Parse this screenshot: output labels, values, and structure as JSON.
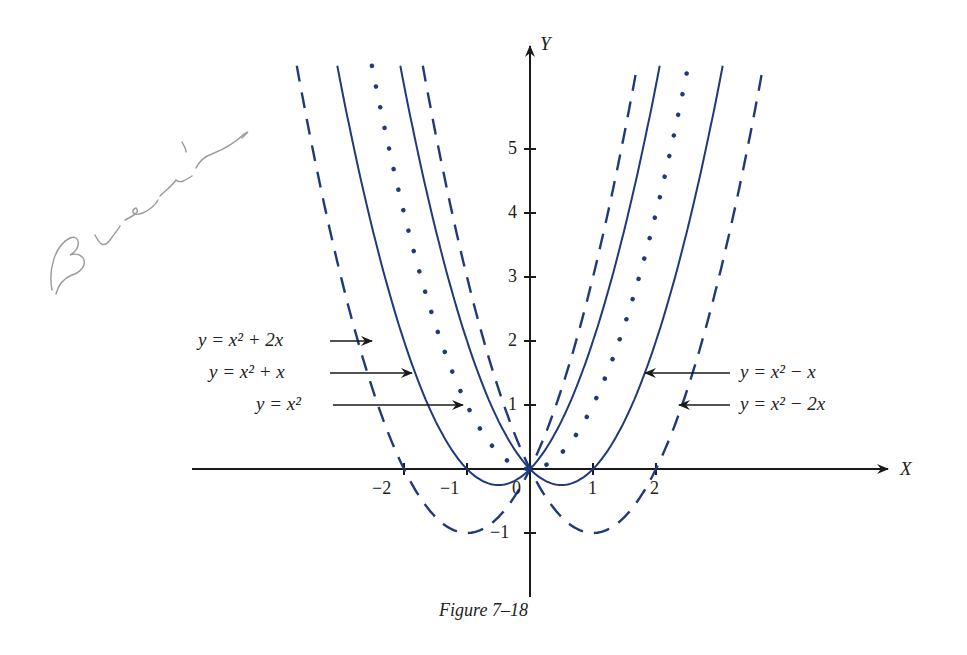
{
  "chart_data": {
    "type": "line",
    "title": "",
    "caption": "Figure 7–18",
    "xlabel": "X",
    "ylabel": "Y",
    "xlim": [
      -5.3,
      6.2
    ],
    "ylim": [
      -2.0,
      6.3
    ],
    "grid": false,
    "x_ticks": [
      -2,
      -1,
      0,
      1,
      2
    ],
    "x_tick_labels": [
      "−2",
      "−1",
      "0",
      "1",
      "2"
    ],
    "y_ticks": [
      -1,
      1,
      2,
      3,
      4,
      5
    ],
    "y_tick_labels": [
      "−1",
      "1",
      "2",
      "3",
      "4",
      "5"
    ],
    "series": [
      {
        "name": "y = x² + 2x",
        "formula": "x^2 + 2x",
        "a": 2,
        "style": "dashed",
        "label_side": "left"
      },
      {
        "name": "y = x² + x",
        "formula": "x^2 + x",
        "a": 1,
        "style": "solid",
        "label_side": "left"
      },
      {
        "name": "y = x²",
        "formula": "x^2",
        "a": 0,
        "style": "dotted",
        "label_side": "left"
      },
      {
        "name": "y = x² − x",
        "formula": "x^2 - x",
        "a": -1,
        "style": "solid",
        "label_side": "right"
      },
      {
        "name": "y = x² − 2x",
        "formula": "x^2 - 2x",
        "a": -2,
        "style": "dashed",
        "label_side": "right"
      }
    ],
    "vertices": [
      {
        "series": "y = x² + 2x",
        "x": -1,
        "y": -1
      },
      {
        "series": "y = x² + x",
        "x": -0.5,
        "y": -0.25
      },
      {
        "series": "y = x²",
        "x": 0,
        "y": 0
      },
      {
        "series": "y = x² − x",
        "x": 0.5,
        "y": -0.25
      },
      {
        "series": "y = x² − 2x",
        "x": 1,
        "y": -1
      }
    ],
    "annotations": [
      {
        "text": "y = x² + 2x",
        "arrow_to_y": 2.0
      },
      {
        "text": "y = x² + x",
        "arrow_to_y": 1.5
      },
      {
        "text": "y = x²",
        "arrow_to_y": 1.0
      },
      {
        "text": "y = x² − x",
        "arrow_to_y": 1.5
      },
      {
        "text": "y = x² − 2x",
        "arrow_to_y": 1.0
      }
    ],
    "colors": {
      "curves": "#1f3a7a",
      "axes": "#1a1a1a"
    }
  },
  "labels": {
    "caption": "Figure 7–18",
    "x_axis": "X",
    "y_axis": "Y",
    "eq_plus2x": "y = x² + 2x",
    "eq_plusx": "y = x² + x",
    "eq_x2": "y = x²",
    "eq_minusx": "y = x² − x",
    "eq_minus2x": "y = x² − 2x",
    "tick_x_m2": "−2",
    "tick_x_m1": "−1",
    "tick_x_0": "0",
    "tick_x_1": "1",
    "tick_x_2": "2",
    "tick_y_m1": "−1",
    "tick_y_1": "1",
    "tick_y_2": "2",
    "tick_y_3": "3",
    "tick_y_4": "4",
    "tick_y_5": "5"
  },
  "annotation_handwriting": "signature (pencil)"
}
